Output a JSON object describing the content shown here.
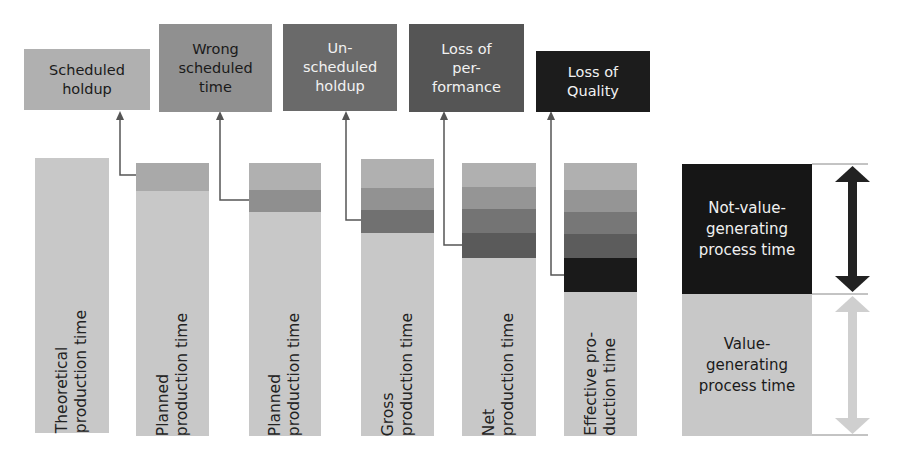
{
  "colors": {
    "base": "#c8c8c8",
    "scheduled_holdup": "#a9a9a9",
    "wrong_scheduled_time": "#8f8f8f",
    "unscheduled_holdup": "#6e6e6e",
    "loss_of_performance": "#565656",
    "loss_of_quality": "#1a1a1a",
    "connector": "#555555"
  },
  "loss_boxes": [
    {
      "label": "Scheduled\nholdup",
      "color": "#b0b0b0",
      "text_color": "#1a1a1a"
    },
    {
      "label": "Wrong\nscheduled\ntime",
      "color": "#909090",
      "text_color": "#1a1a1a"
    },
    {
      "label": "Un-\nscheduled\nholdup",
      "color": "#6a6a6a",
      "text_color": "#f2f2f2"
    },
    {
      "label": "Loss of\nper-\nformance",
      "color": "#555555",
      "text_color": "#f2f2f2"
    },
    {
      "label": "Loss of\nQuality",
      "color": "#1c1c1c",
      "text_color": "#f2f2f2"
    }
  ],
  "bars": [
    {
      "label": "Theoretical\nproduction time"
    },
    {
      "label": "Planned\nproduction time"
    },
    {
      "label": "Planned\nproduction time"
    },
    {
      "label": "Gross\nproduction time"
    },
    {
      "label": "Net\nproduction time"
    },
    {
      "label": "Effective pro-\nduction time"
    }
  ],
  "legend": {
    "not_value": "Not-value-\ngenerating\nprocess time",
    "value": "Value-\ngenerating\nprocess time"
  }
}
